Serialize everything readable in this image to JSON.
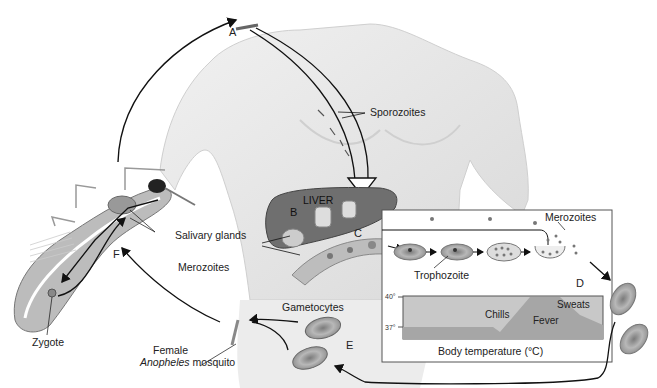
{
  "stage_letters": {
    "a": "A",
    "b": "B",
    "c": "C",
    "d": "D",
    "e": "E",
    "f": "F"
  },
  "labels": {
    "sporozoites": "Sporozoites",
    "liver": "LIVER",
    "merozoites_liver": "Merozoites",
    "merozoites_blood": "Merozoites",
    "trophozoite": "Trophozoite",
    "salivary_glands": "Salivary glands",
    "zygote": "Zygote",
    "gametocytes": "Gametocytes",
    "female": "Female",
    "species": "Anopheles",
    "mosquito": "mosquito"
  },
  "temperature_chart": {
    "title": "Body temperature (°C)",
    "y_ticks": [
      "40°",
      "37°"
    ],
    "phases": [
      "Chills",
      "Fever",
      "Sweats"
    ]
  },
  "colors": {
    "skin": "#e6e6e6",
    "liver": "#6f6f6f",
    "vessel": "#bdbdbd",
    "cell": "#9a9a9a",
    "chart_bg": "#c8c8c8",
    "chart_fever": "#a6a6a6",
    "line": "#111111"
  }
}
